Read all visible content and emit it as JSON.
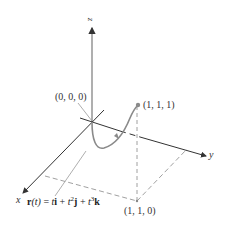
{
  "figure": {
    "axes": {
      "x_label": "x",
      "y_label": "y",
      "z_label": "z"
    },
    "points": [
      {
        "name": "origin",
        "label": "(0, 0, 0)"
      },
      {
        "name": "end-point",
        "label": "(1, 1, 1)"
      },
      {
        "name": "projection-point",
        "label": "(1, 1, 0)"
      }
    ],
    "equation": {
      "lhs": "r",
      "arg": "(t)",
      "eq": " = ",
      "t1": "t",
      "i": "i",
      "plus1": " + ",
      "t2": "t",
      "exp2": "2",
      "j": "j",
      "plus2": " + ",
      "t3": "t",
      "exp3": "3",
      "k": "k"
    },
    "colors": {
      "axis": "#333333",
      "curve": "#8a8a8a",
      "dashed": "#888888",
      "text": "#333333"
    }
  }
}
